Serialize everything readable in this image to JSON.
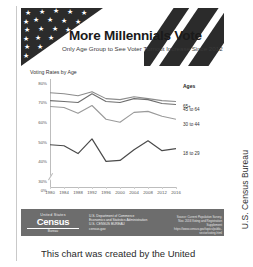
{
  "document": {
    "side_caption": "U.S. Census Bureau",
    "body_caption": "This chart was created by the United"
  },
  "infographic": {
    "title": "More Millennials Vote",
    "subtitle": "Only Age Group to See Voter Turnout Increase Since 2012",
    "chart_label": "Voting Rates by Age",
    "legend_title": "Ages"
  },
  "footer": {
    "logo_top": "United States",
    "logo_word": "Census",
    "logo_sub": "Bureau",
    "agency_line1": "U.S. Department of Commerce",
    "agency_line2": "Economics and Statistics Administration",
    "agency_line3": "U.S. CENSUS BUREAU",
    "agency_line4": "census.gov",
    "source_line1": "Source: Current Population Survey,",
    "source_line2": "Nov. 2016 Voting and Registration Supplement",
    "source_line3": "https://www.census.gov/topics/public-sector/voting.html"
  },
  "colors": {
    "banner_dark": "#2b2b2b",
    "footer_gray": "#6d6d6d",
    "line_65plus": "#8c8c8c",
    "line_45to64": "#6f6f6f",
    "line_30to44": "#9a9a9a",
    "line_18to29": "#4a4a4a"
  },
  "chart_data": {
    "type": "line",
    "title": "Voting Rates by Age",
    "xlabel": "",
    "ylabel": "",
    "x": [
      1980,
      1984,
      1988,
      1992,
      1996,
      2000,
      2004,
      2008,
      2012,
      2016
    ],
    "xticklabels": [
      "1980",
      "1984",
      "1988",
      "1992",
      "1996",
      "2000",
      "2004",
      "2008",
      "2012",
      "2016"
    ],
    "yticklabels": [
      "80%",
      "70%",
      "60%",
      "50%",
      "40%",
      "30%",
      "0%"
    ],
    "ytickvalues": [
      80,
      70,
      60,
      50,
      40,
      30,
      0
    ],
    "ylim": [
      28,
      82
    ],
    "axis_break": true,
    "grid": false,
    "legend_position": "right",
    "series": [
      {
        "name": "65+",
        "values": [
          75.0,
          74.5,
          73.5,
          75.5,
          72.0,
          71.5,
          73.0,
          72.0,
          71.0,
          70.5
        ]
      },
      {
        "name": "45 to 64",
        "values": [
          71.0,
          70.5,
          70.0,
          74.5,
          70.5,
          70.0,
          72.0,
          71.5,
          69.5,
          69.0
        ]
      },
      {
        "name": "30 to 44",
        "values": [
          68.0,
          67.5,
          64.5,
          68.5,
          61.5,
          60.0,
          65.0,
          65.5,
          63.0,
          61.5
        ]
      },
      {
        "name": "18 to 29",
        "values": [
          48.5,
          48.0,
          44.0,
          51.5,
          40.0,
          40.5,
          46.0,
          50.5,
          45.5,
          46.5
        ]
      }
    ]
  }
}
